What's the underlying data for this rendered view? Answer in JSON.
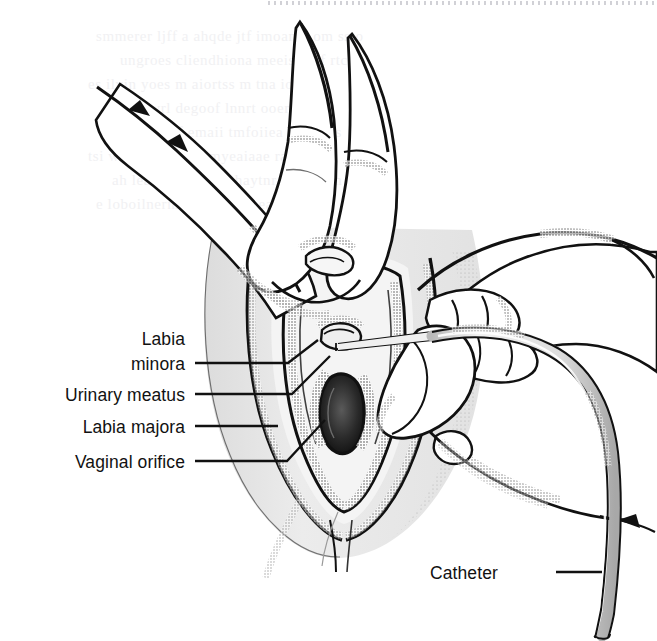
{
  "figure": {
    "background_color": "#ffffff",
    "ink_color": "#111111",
    "tone_color": "#e7e7e7",
    "scan_artifact": "dotted-scan-line-top-right"
  },
  "labels": [
    {
      "id": "labia-minora",
      "line1": "Labia",
      "line2": "minora",
      "text_x": 185,
      "line_y": 363,
      "leader": "M195,363 H288 L318,340"
    },
    {
      "id": "urinary-meatus",
      "line1": "Urinary meatus",
      "line2": "",
      "text_x": 185,
      "line_y": 394,
      "leader": "M195,394 H292 L330,356"
    },
    {
      "id": "labia-majora",
      "line1": "Labia majora",
      "line2": "",
      "text_x": 185,
      "line_y": 426,
      "leader": "M195,426 H278"
    },
    {
      "id": "vaginal-orifice",
      "line1": "Vaginal orifice",
      "line2": "",
      "text_x": 185,
      "line_y": 461,
      "leader": "M195,461 H287 L325,420"
    },
    {
      "id": "catheter",
      "line1": "Catheter",
      "line2": "",
      "text_x": 545,
      "line_y": 572,
      "leader": "M556,572 H602"
    }
  ],
  "anatomy_parts": [
    "labia minora",
    "urinary meatus",
    "labia majora",
    "vaginal orifice",
    "catheter",
    "left hand fingers",
    "right hand",
    "perineum"
  ]
}
